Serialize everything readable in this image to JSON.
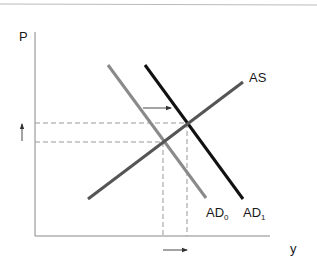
{
  "diagram": {
    "type": "AD-AS shift",
    "axes": {
      "y_label": "P",
      "x_label": "y"
    },
    "curves": [
      {
        "id": "AD0",
        "label": "AD",
        "subscript": "0",
        "color": "#8a8a8a"
      },
      {
        "id": "AD1",
        "label": "AD",
        "subscript": "1",
        "color": "#111111"
      },
      {
        "id": "AS",
        "label": "AS",
        "color": "#555555"
      }
    ],
    "annotations": {
      "shift_arrow": "AD shifts right (AD0 → AD1)",
      "price_arrow": "price level rises",
      "output_arrow": "output rises"
    },
    "colors": {
      "axis": "#888888",
      "dashed": "#999999",
      "top_rule": "#bbbbbb",
      "arrow": "#333333"
    }
  },
  "labels": {
    "p": "P",
    "y": "y",
    "as": "AS",
    "ad0_main": "AD",
    "ad0_sub": "0",
    "ad1_main": "AD",
    "ad1_sub": "1"
  }
}
